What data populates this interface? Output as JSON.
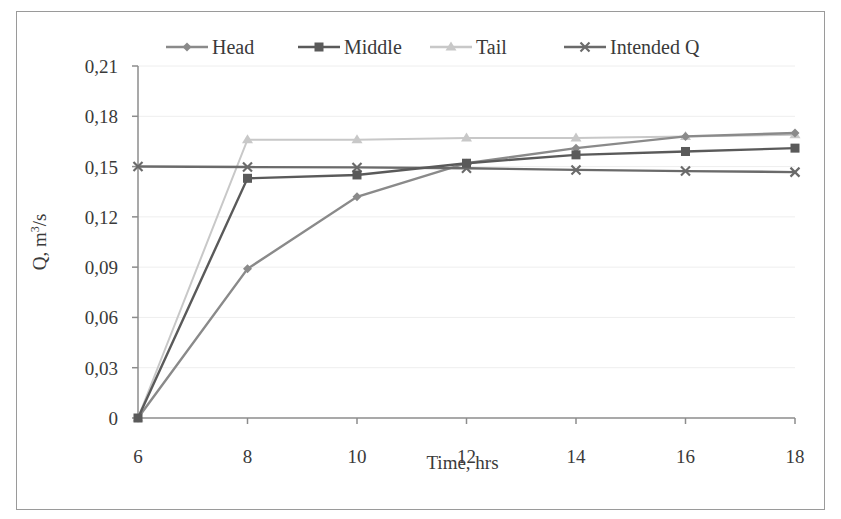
{
  "chart_data": {
    "type": "line",
    "title": "",
    "xlabel": "Time, hrs",
    "ylabel": "Q, m³/s",
    "ylabel_base": "Q, m",
    "ylabel_sup": "3",
    "ylabel_tail": "/s",
    "x": [
      6,
      8,
      10,
      12,
      14,
      16,
      18
    ],
    "x_ticks": [
      "6",
      "8",
      "10",
      "12",
      "14",
      "16",
      "18"
    ],
    "y_ticks": [
      "0",
      "0,03",
      "0,06",
      "0,09",
      "0,12",
      "0,15",
      "0,18",
      "0,21"
    ],
    "xlim": [
      6,
      18
    ],
    "ylim": [
      0,
      0.21
    ],
    "grid": true,
    "legend_position": "top",
    "series": [
      {
        "name": "Head",
        "marker": "diamond",
        "color": "#8a8a8a",
        "values": [
          0,
          0.089,
          0.132,
          0.152,
          0.161,
          0.168,
          0.17
        ]
      },
      {
        "name": "Middle",
        "marker": "square",
        "color": "#5a5a5a",
        "values": [
          0,
          0.143,
          0.145,
          0.152,
          0.157,
          0.159,
          0.161
        ]
      },
      {
        "name": "Tail",
        "marker": "triangle",
        "color": "#c8c8c8",
        "values": [
          0,
          0.166,
          0.166,
          0.167,
          0.167,
          0.168,
          0.169
        ]
      },
      {
        "name": "Intended Q",
        "marker": "x",
        "color": "#6a6a6a",
        "values": [
          0.15,
          0.1497,
          0.1495,
          0.149,
          0.148,
          0.1473,
          0.1467
        ]
      }
    ]
  }
}
